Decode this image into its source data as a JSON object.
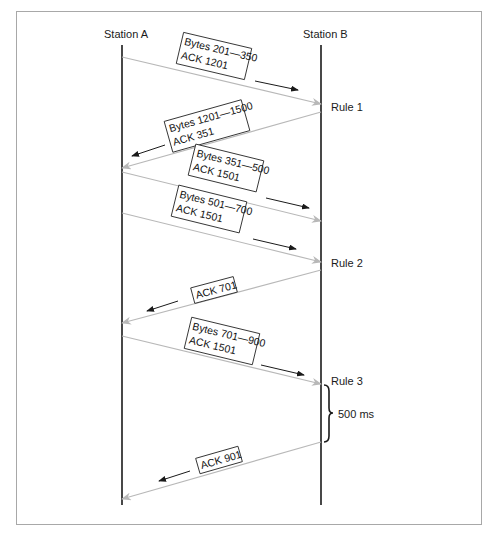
{
  "stations": [
    {
      "label": "Station A",
      "x": 122,
      "label_x": 104,
      "label_y": 38
    },
    {
      "label": "Station B",
      "x": 321,
      "label_x": 303,
      "label_y": 38
    }
  ],
  "timeline": {
    "top": 45,
    "bottom": 505
  },
  "messages": [
    {
      "id": "m1",
      "from": "A",
      "to": "B",
      "y1": 57,
      "y2": 104,
      "lines": [
        "Bytes 201—350",
        "ACK 1201"
      ],
      "box": {
        "cx": 214,
        "cy": 56,
        "w": 70,
        "h": 32
      },
      "dir": {
        "x1": 255,
        "y1": 81,
        "x2": 298,
        "y2": 90
      }
    },
    {
      "id": "m2",
      "from": "B",
      "to": "A",
      "y1": 112,
      "y2": 168,
      "lines": [
        "Bytes 1201—1500",
        "ACK 351"
      ],
      "box": {
        "cx": 207,
        "cy": 126,
        "w": 80,
        "h": 32
      },
      "dir": {
        "x1": 165,
        "y1": 145,
        "x2": 132,
        "y2": 156
      }
    },
    {
      "id": "m3",
      "from": "A",
      "to": "B",
      "y1": 172,
      "y2": 221,
      "lines": [
        "Bytes 351—500",
        "ACK 1501"
      ],
      "box": {
        "cx": 226,
        "cy": 168,
        "w": 70,
        "h": 32
      },
      "dir": {
        "x1": 266,
        "y1": 198,
        "x2": 309,
        "y2": 208
      }
    },
    {
      "id": "m4",
      "from": "A",
      "to": "B",
      "y1": 213,
      "y2": 262,
      "lines": [
        "Bytes 501—700",
        "ACK 1501"
      ],
      "box": {
        "cx": 209,
        "cy": 209,
        "w": 70,
        "h": 32
      },
      "dir": {
        "x1": 253,
        "y1": 239,
        "x2": 296,
        "y2": 249
      }
    },
    {
      "id": "m5",
      "from": "B",
      "to": "A",
      "y1": 270,
      "y2": 323,
      "lines": [
        "ACK 701"
      ],
      "box": {
        "cx": 214,
        "cy": 290,
        "w": 44,
        "h": 16
      },
      "dir": {
        "x1": 178,
        "y1": 301,
        "x2": 147,
        "y2": 311
      }
    },
    {
      "id": "m6",
      "from": "A",
      "to": "B",
      "y1": 336,
      "y2": 384,
      "lines": [
        "Bytes 701—900",
        "ACK 1501"
      ],
      "box": {
        "cx": 222,
        "cy": 341,
        "w": 70,
        "h": 32
      },
      "dir": {
        "x1": 261,
        "y1": 365,
        "x2": 304,
        "y2": 375
      }
    },
    {
      "id": "m7",
      "from": "B",
      "to": "A",
      "y1": 442,
      "y2": 499,
      "lines": [
        "ACK 901"
      ],
      "box": {
        "cx": 219,
        "cy": 460,
        "w": 44,
        "h": 16
      },
      "dir": {
        "x1": 190,
        "y1": 471,
        "x2": 159,
        "y2": 481
      }
    }
  ],
  "rules": [
    {
      "label": "Rule 1",
      "x": 331,
      "y": 111
    },
    {
      "label": "Rule 2",
      "x": 331,
      "y": 267
    },
    {
      "label": "Rule 3",
      "x": 331,
      "y": 385
    }
  ],
  "timer": {
    "label": "500 ms",
    "brace_x": 324,
    "y_top": 385,
    "y_bottom": 442,
    "label_x": 338,
    "label_y": 418
  },
  "colors": {
    "station_line": "#1a1a1a",
    "message_line": "#b8b8b8",
    "frame_border": "#a8a8a8"
  }
}
